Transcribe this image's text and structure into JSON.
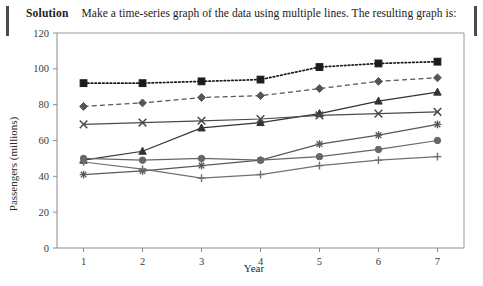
{
  "solution": {
    "label": "Solution",
    "text": "Make a time-series graph of the data using multiple lines. The resulting graph is:"
  },
  "chart_data": {
    "type": "line",
    "title": "",
    "xlabel": "Year",
    "ylabel": "Passengers (millions)",
    "x": [
      1,
      2,
      3,
      4,
      5,
      6,
      7
    ],
    "xtick_labels": [
      "1",
      "2",
      "3",
      "4",
      "5",
      "6",
      "7"
    ],
    "ytick_labels": [
      "0",
      "20",
      "40",
      "60",
      "80",
      "100",
      "120"
    ],
    "xlim": [
      0.55,
      7.45
    ],
    "ylim": [
      0,
      120
    ],
    "grid": false,
    "legend": "none",
    "series": [
      {
        "name": "series-square-dotted",
        "marker": "square",
        "linestyle": "dotted",
        "color": "#1b1b1b",
        "values": [
          92,
          92,
          93,
          94,
          101,
          103,
          104
        ]
      },
      {
        "name": "series-diamond-dashed",
        "marker": "diamond",
        "linestyle": "dashed",
        "color": "#555555",
        "values": [
          79,
          81,
          84,
          85,
          89,
          93,
          95
        ]
      },
      {
        "name": "series-triangle-solid",
        "marker": "triangle",
        "linestyle": "solid",
        "color": "#333333",
        "values": [
          49,
          54,
          67,
          70,
          75,
          82,
          87
        ]
      },
      {
        "name": "series-x-solid",
        "marker": "x",
        "linestyle": "solid",
        "color": "#4a4a4a",
        "values": [
          69,
          70,
          71,
          72,
          74,
          75,
          76
        ]
      },
      {
        "name": "series-asterisk-solid",
        "marker": "asterisk",
        "linestyle": "solid",
        "color": "#585858",
        "values": [
          41,
          43,
          46,
          49,
          58,
          63,
          69
        ]
      },
      {
        "name": "series-circle-solid",
        "marker": "circle",
        "linestyle": "solid",
        "color": "#666666",
        "values": [
          50,
          49,
          50,
          49,
          51,
          55,
          60
        ]
      },
      {
        "name": "series-plus-solid",
        "marker": "plus",
        "linestyle": "solid",
        "color": "#707070",
        "values": [
          48,
          44,
          39,
          41,
          46,
          49,
          51
        ]
      }
    ]
  }
}
